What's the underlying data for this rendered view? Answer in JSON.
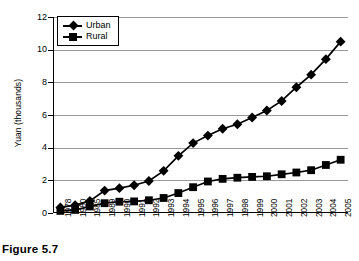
{
  "caption": "Figure 5.7",
  "chart_data": {
    "type": "line",
    "title": "",
    "xlabel": "",
    "ylabel": "Yuan (thousands)",
    "ylim": [
      0,
      12
    ],
    "yticks": [
      0,
      2,
      4,
      6,
      8,
      10,
      12
    ],
    "grid": true,
    "legend_position": "top-left",
    "categories": [
      "1978",
      "1980",
      "1985",
      "1989",
      "1990",
      "1991",
      "1992",
      "1993",
      "1994",
      "1995",
      "1996",
      "1997",
      "1998",
      "1999",
      "2000",
      "2001",
      "2002",
      "2003",
      "2004",
      "2005"
    ],
    "series": [
      {
        "name": "Urban",
        "marker": "diamond",
        "color": "#000000",
        "values": [
          0.34,
          0.48,
          0.74,
          1.37,
          1.52,
          1.7,
          1.96,
          2.58,
          3.5,
          4.28,
          4.74,
          5.16,
          5.43,
          5.85,
          6.28,
          6.86,
          7.7,
          8.47,
          9.42,
          10.49
        ]
      },
      {
        "name": "Rural",
        "marker": "square",
        "color": "#000000",
        "values": [
          0.13,
          0.19,
          0.4,
          0.6,
          0.69,
          0.71,
          0.78,
          0.92,
          1.22,
          1.58,
          1.93,
          2.09,
          2.16,
          2.21,
          2.25,
          2.37,
          2.48,
          2.62,
          2.94,
          3.26
        ]
      }
    ]
  }
}
